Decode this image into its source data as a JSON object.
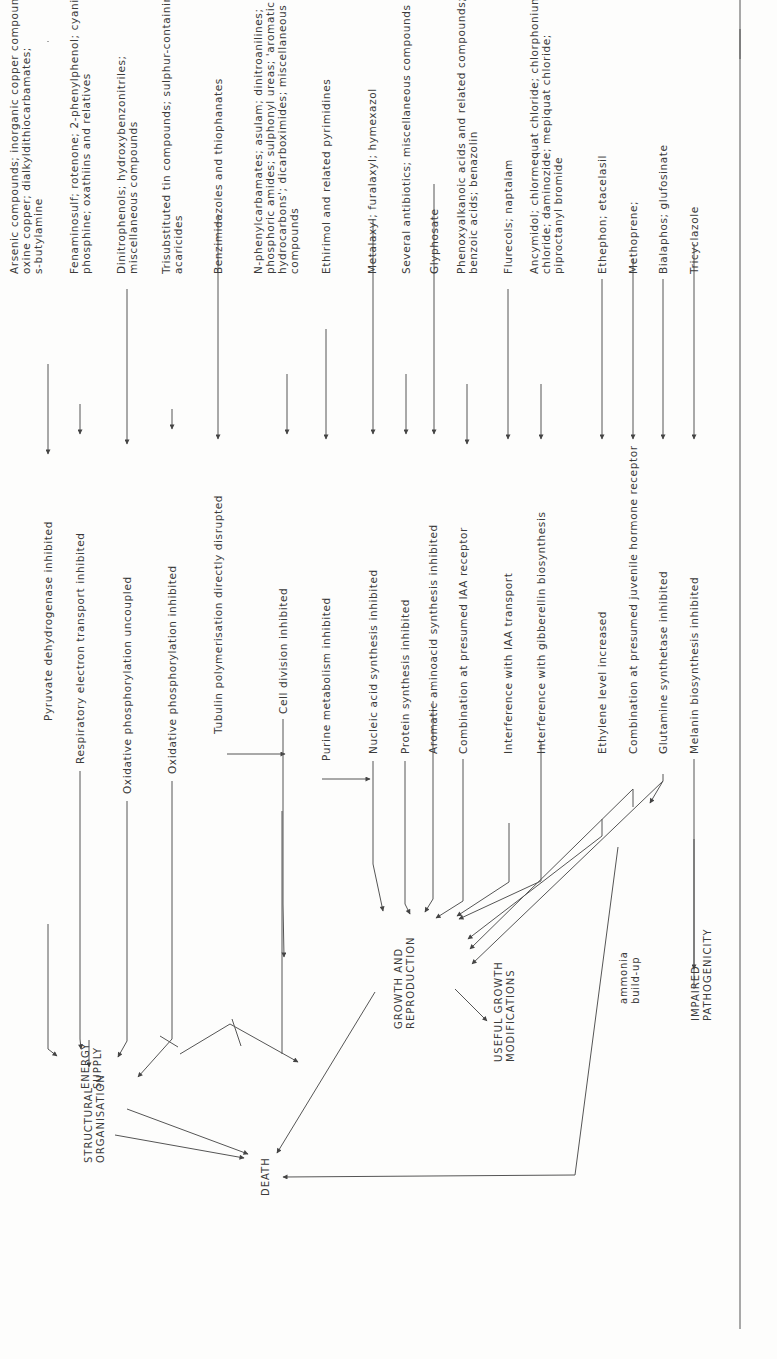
{
  "figure": {
    "orientation": "rotated 90 degrees counter-clockwise",
    "outcomes": {
      "death": "DEATH",
      "energy_supply": "ENERGY\nSUPPLY",
      "structural_organisation": "STRUCTURAL\nORGANISATION",
      "growth_and_reproduction": "GROWTH AND\nREPRODUCTION",
      "useful_growth_modifications": "USEFUL GROWTH\nMODIFICATIONS",
      "ammonia_build_up": "ammonia\nbuild-up",
      "impaired_pathogenicity": "IMPAIRED\nPATHOGENICITY"
    },
    "compounds": [
      "Arsenic compounds; inorganic copper compounds;\noxine copper; dialkyldithiocarbamates;\ns-butylamine",
      "Fenaminosulf; rotenone; 2-phenylphenol; cyanide;\nphosphine; oxathiins and relatives",
      "Dinitrophenols; hydroxybenzonitriles;\nmiscellaneous compounds",
      "Trisubstituted tin compounds; sulphur-containing\nacaricides",
      "Benzimidazoles and thiophanates",
      "N-phenylcarbamates; asulam; dinitroanilines;\nphosphoric amides; sulphonyl ureas; 'aromatic\nhydrocarbons'; dicarboximides; miscellaneous\ncompounds",
      "Ethirimol and related pyrimidines",
      "Metalaxyl; furalaxyl; hymexazol",
      "Several antibiotics; miscellaneous compounds",
      "Glyphosate",
      "Phenoxyalkanoic acids and related compounds;\nbenzoic acids; benazolin",
      "Flurecols; naptalam",
      "Ancymidol; chlormequat chloride; chlorphonium\nchloride; daminozide; mepiquat chloride;\npiproctanyl bromide",
      "Ethephon; etacelasil",
      "Methoprene;",
      "Bialaphos; glufosinate",
      "Tricyclazole"
    ],
    "mechanisms": [
      "Pyruvate dehydrogenase inhibited",
      "Respiratory electron transport inhibited",
      "Oxidative phosphorylation uncoupled",
      "Oxidative phosphorylation inhibited",
      "Tubulin polymerisation directly disrupted",
      "Cell division inhibited",
      "Purine metabolism inhibited",
      "Nucleic acid synthesis inhibited",
      "Protein synthesis inhibited",
      "Aromatic aminoacid synthesis inhibited",
      "Combination at presumed IAA receptor",
      "Interference with IAA transport",
      "Interference with gibberellin biosynthesis",
      "Ethylene level increased",
      "Combination at presumed juvenile hormone receptor",
      "Glutamine synthetase inhibited",
      "Melanin biosynthesis inhibited"
    ]
  }
}
